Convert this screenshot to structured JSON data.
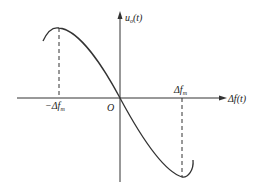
{
  "diagram": {
    "type": "frequency discriminator characteristic curve",
    "axes": {
      "y_label": {
        "main": "u",
        "sub": "o",
        "arg": "(t)"
      },
      "x_label": {
        "main": "Δf",
        "arg": "(t)"
      },
      "origin_label": "O"
    },
    "ticks": {
      "negative": {
        "prefix": "−Δf",
        "sub": "m"
      },
      "positive": {
        "prefix": "Δf",
        "sub": "m"
      }
    },
    "colors": {
      "line": "#333333",
      "text": "#222222",
      "background": "#ffffff"
    }
  }
}
